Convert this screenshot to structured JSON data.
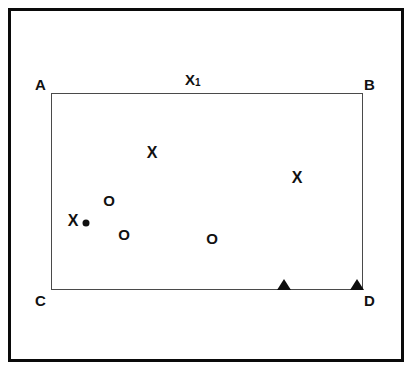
{
  "figure": {
    "title": "",
    "outer_frame": {
      "color": "#0a0a0a"
    },
    "rectangle": {
      "border_color": "#4a4a4a",
      "corner_labels": [
        {
          "name": "A",
          "text": "A"
        },
        {
          "name": "B",
          "text": "B"
        },
        {
          "name": "C",
          "text": "C"
        },
        {
          "name": "D",
          "text": "D"
        }
      ],
      "edge_labels": [
        {
          "name": "top-edge-label",
          "text": "X",
          "subscript": "1"
        }
      ]
    },
    "markers": {
      "x_markers": [
        {
          "label": "X",
          "x": 152,
          "y": 153
        },
        {
          "label": "X",
          "x": 297,
          "y": 178
        },
        {
          "label": "X",
          "x": 73,
          "y": 221
        }
      ],
      "o_markers": [
        {
          "label": "O",
          "x": 109,
          "y": 200
        },
        {
          "label": "O",
          "x": 124,
          "y": 234
        },
        {
          "label": "O",
          "x": 212,
          "y": 238
        }
      ],
      "dot_markers": [
        {
          "label": "dot",
          "x": 86,
          "y": 223
        }
      ],
      "triangle_markers": [
        {
          "label": "triangle",
          "x": 284,
          "y": 290
        },
        {
          "label": "triangle",
          "x": 357,
          "y": 290
        }
      ]
    }
  }
}
